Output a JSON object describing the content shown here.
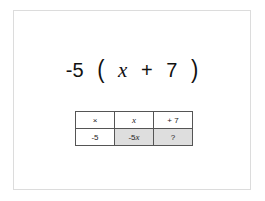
{
  "expression": {
    "coefficient": "-5",
    "open_paren": "(",
    "variable": "x",
    "operator": "+",
    "constant": "7",
    "close_paren": ")"
  },
  "table": {
    "header": {
      "corner": "×",
      "col1": "x",
      "col2": "+ 7"
    },
    "row": {
      "multiplier": "-5",
      "product1_coef": "-5",
      "product1_var": "x",
      "product2": "?"
    },
    "shaded_color": "#dedede"
  }
}
